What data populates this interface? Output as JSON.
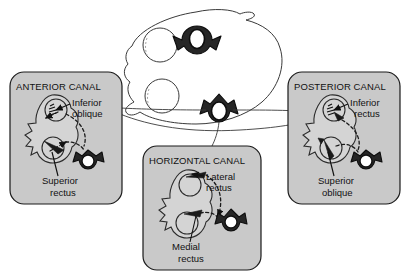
{
  "figure": {
    "background_color": "#ffffff",
    "panel_fill_color": "#c9c9c9",
    "panel_border_color": "#1a1a1a",
    "text_color": "#111111"
  },
  "head_diagram": {
    "name": "superior view of head",
    "icons": [
      {
        "name": "anterior-canal-marker",
        "orientation": "down"
      },
      {
        "name": "horizontal-posterior-canal-marker",
        "orientation": "up"
      }
    ]
  },
  "panels": [
    {
      "id": "anterior",
      "title": "ANTERIOR CANAL",
      "labels": [
        {
          "id": "inferior-oblique",
          "line1": "Inferior",
          "line2": "oblique"
        },
        {
          "id": "superior-rectus",
          "line1": "Superior",
          "line2": "rectus"
        }
      ]
    },
    {
      "id": "horizontal",
      "title": "HORIZONTAL CANAL",
      "labels": [
        {
          "id": "lateral-rectus",
          "line1": "Lateral",
          "line2": "rectus"
        },
        {
          "id": "medial-rectus",
          "line1": "Medial",
          "line2": "rectus"
        }
      ]
    },
    {
      "id": "posterior",
      "title": "POSTERIOR CANAL",
      "labels": [
        {
          "id": "inferior-rectus",
          "line1": "Inferior",
          "line2": "rectus"
        },
        {
          "id": "superior-oblique",
          "line1": "Superior",
          "line2": "oblique"
        }
      ]
    }
  ]
}
